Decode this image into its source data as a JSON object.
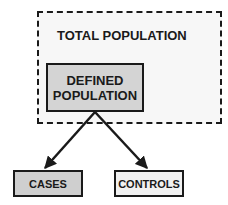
{
  "diagram": {
    "outer_box": {
      "label": "TOTAL POPULATION",
      "style": "dashed"
    },
    "defined_box": {
      "line1": "DEFINED",
      "line2": "POPULATION"
    },
    "cases_box": {
      "label": "CASES"
    },
    "controls_box": {
      "label": "CONTROLS"
    },
    "edges": [
      {
        "from": "DEFINED POPULATION",
        "to": "CASES"
      },
      {
        "from": "DEFINED POPULATION",
        "to": "CONTROLS"
      }
    ],
    "colors": {
      "outer_fill": "#f7f7f7",
      "defined_fill": "#d4d4d4",
      "cases_fill": "#cfcfcf",
      "controls_fill": "#f1f1f1",
      "stroke": "#1a1a1a"
    }
  }
}
